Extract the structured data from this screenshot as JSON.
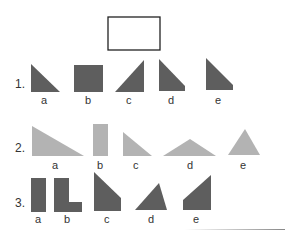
{
  "target_box": {
    "x": 108,
    "y": 17,
    "w": 52,
    "h": 33,
    "stroke": "#222"
  },
  "colors": {
    "dark": "#5e5e5e",
    "light": "#b3b3b3"
  },
  "rows": [
    {
      "number": "1.",
      "num_pos": [
        15,
        89
      ],
      "fill": "dark",
      "shapes": [
        {
          "label": "a",
          "points": "31,64 60,92 31,92",
          "label_pos": [
            41,
            96
          ]
        },
        {
          "label": "b",
          "points": "74,65 103,65 103,92 74,92",
          "label_pos": [
            85,
            96
          ]
        },
        {
          "label": "c",
          "points": "115,92 144,60 144,92",
          "label_pos": [
            126,
            96
          ]
        },
        {
          "label": "d",
          "points": "159,59 185,86 185,91 159,91",
          "label_pos": [
            168,
            96
          ]
        },
        {
          "label": "e",
          "points": "206,58 233,85 233,90 206,90",
          "label_pos": [
            215,
            96
          ]
        }
      ]
    },
    {
      "number": "2.",
      "num_pos": [
        15,
        153
      ],
      "fill": "light",
      "shapes": [
        {
          "label": "a",
          "points": "32,126 84,156 32,156",
          "label_pos": [
            52,
            161
          ]
        },
        {
          "label": "b",
          "points": "93,124 108,124 108,156 93,156",
          "label_pos": [
            97,
            161
          ]
        },
        {
          "label": "c",
          "points": "123,132 152,156 123,156",
          "label_pos": [
            133,
            161
          ]
        },
        {
          "label": "d",
          "points": "163,156 190,139 216,156",
          "label_pos": [
            187,
            161
          ]
        },
        {
          "label": "e",
          "points": "228,155 245,129 260,155",
          "label_pos": [
            240,
            161
          ]
        }
      ]
    },
    {
      "number": "3.",
      "num_pos": [
        15,
        208
      ],
      "fill": "dark",
      "shapes": [
        {
          "label": "a",
          "points": "31,178 46,178 46,212 31,212",
          "label_pos": [
            35,
            215
          ]
        },
        {
          "label": "b",
          "points": "54,178 69,178 69,202 82,202 82,212 54,212",
          "label_pos": [
            64,
            215
          ]
        },
        {
          "label": "c",
          "points": "94,172 121,198 121,211 94,211",
          "label_pos": [
            104,
            215
          ]
        },
        {
          "label": "d",
          "points": "135,210 159,183 167,210",
          "label_pos": [
            148,
            215
          ]
        },
        {
          "label": "e",
          "points": "183,200 211,175 211,210 183,210",
          "label_pos": [
            193,
            215
          ]
        }
      ]
    }
  ]
}
